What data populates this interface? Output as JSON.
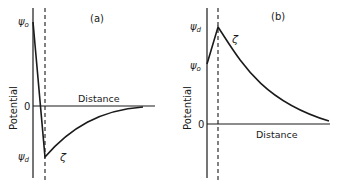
{
  "panels": [
    {
      "id": "a",
      "label": "(a)",
      "y_axis_label": "Potential",
      "x_axis_label": "Distance",
      "zero_label": "0",
      "top_label": "ψ",
      "top_label_sub": "o",
      "bottom_label": "ψ",
      "bottom_label_sub": "d",
      "zeta_label": "ζ"
    },
    {
      "id": "b",
      "label": "(b)",
      "y_axis_label": "Potential",
      "x_axis_label": "Distance",
      "zero_label": "0",
      "top_label": "ψ",
      "top_label_sub": "d",
      "mid_label": "ψ",
      "mid_label_sub": "o",
      "zeta_label": "ζ"
    }
  ],
  "colors": {
    "ink": "#1a1a1a",
    "background": "#ffffff"
  }
}
